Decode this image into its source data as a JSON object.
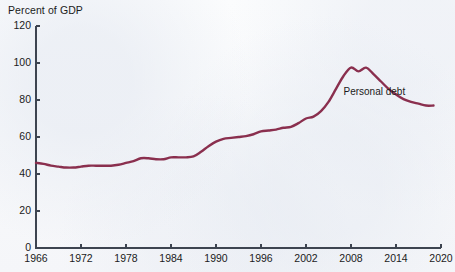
{
  "chart_data": {
    "type": "line",
    "title": "Percent of GDP",
    "xlabel": "",
    "ylabel": "Percent of GDP",
    "ylim": [
      0,
      120
    ],
    "xlim": [
      1966,
      2020
    ],
    "ytick_labels": [
      "0",
      "20",
      "40",
      "60",
      "80",
      "100",
      "120"
    ],
    "yticks": [
      0,
      20,
      40,
      60,
      80,
      100,
      120
    ],
    "xtick_labels": [
      "1966",
      "1972",
      "1978",
      "1984",
      "1990",
      "1996",
      "2002",
      "2008",
      "2014",
      "2020"
    ],
    "xticks": [
      1966,
      1972,
      1978,
      1984,
      1990,
      1996,
      2002,
      2008,
      2014,
      2020
    ],
    "grid": false,
    "legend_position": "inline-right",
    "series": [
      {
        "name": "Personal debt",
        "color": "#8a2f4e",
        "x": [
          1966,
          1967,
          1968,
          1969,
          1970,
          1971,
          1972,
          1973,
          1974,
          1975,
          1976,
          1977,
          1978,
          1979,
          1980,
          1981,
          1982,
          1983,
          1984,
          1985,
          1986,
          1987,
          1988,
          1989,
          1990,
          1991,
          1992,
          1993,
          1994,
          1995,
          1996,
          1997,
          1998,
          1999,
          2000,
          2001,
          2002,
          2003,
          2004,
          2005,
          2006,
          2007,
          2008,
          2009,
          2010,
          2011,
          2012,
          2013,
          2014,
          2015,
          2016,
          2017,
          2018,
          2019
        ],
        "values": [
          46,
          45.5,
          44.5,
          44,
          43.5,
          43.5,
          44,
          44.5,
          44.5,
          44.5,
          44.5,
          45,
          46,
          47,
          48.5,
          48.5,
          48,
          48,
          49,
          49,
          49,
          49.5,
          52,
          55,
          57.5,
          59,
          59.5,
          60,
          60.5,
          61.5,
          63,
          63.5,
          64,
          65,
          65.5,
          67.5,
          70,
          71,
          74,
          79,
          86,
          93,
          97.5,
          95.5,
          97.5,
          94,
          90,
          86,
          83,
          80.5,
          79,
          78,
          77,
          77
        ]
      }
    ],
    "annotations": [
      {
        "text": "Personal debt",
        "x": 2011,
        "y": 84
      }
    ]
  },
  "style": {
    "line_color": "#8a2f4e",
    "axis_color": "#3d4450",
    "text_color": "#1b1b1b",
    "background": "#f8f9fb"
  }
}
